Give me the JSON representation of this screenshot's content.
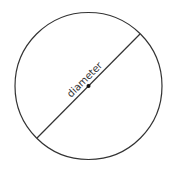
{
  "diagram": {
    "type": "circle-with-diameter",
    "circle": {
      "cx": 88.5,
      "cy": 86,
      "r": 73.5,
      "stroke": "#333333"
    },
    "diameter": {
      "x1": 140,
      "y1": 34,
      "x2": 37,
      "y2": 138,
      "stroke": "#333333"
    },
    "center_point": {
      "cx": 88.5,
      "cy": 86,
      "r": 2,
      "fill": "#111111"
    },
    "label": {
      "text": "diameter",
      "angle": -45,
      "x": 87,
      "y": 82
    }
  }
}
